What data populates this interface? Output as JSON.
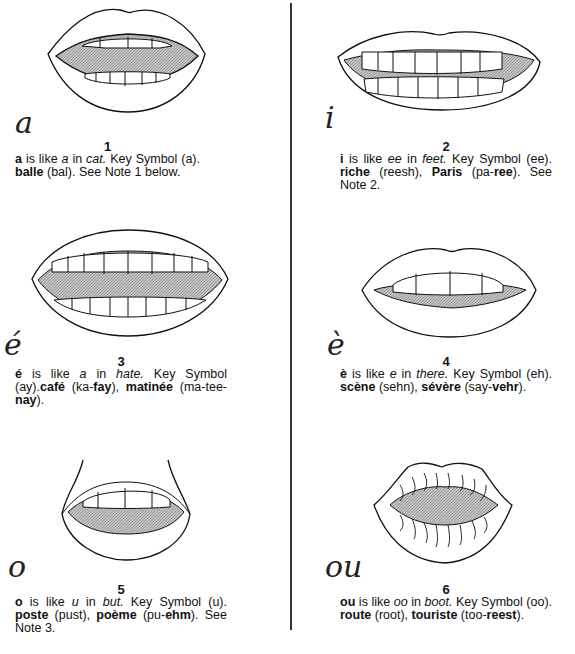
{
  "entries": [
    {
      "number": "1",
      "letter": "a",
      "cursive_glyph": "a",
      "line1": {
        "vowel": "a",
        "t1": " is like ",
        "example": "a",
        "t2": " in ",
        "word": "cat.",
        "t3": " Key Symbol (a)."
      },
      "line2": [
        {
          "text": "balle",
          "bold": true
        },
        {
          "text": " (bal). See Note 1 below.",
          "bold": false
        }
      ]
    },
    {
      "number": "2",
      "letter": "i",
      "cursive_glyph": "i",
      "line1": {
        "vowel": "i",
        "t1": " is like ",
        "example": "ee",
        "t2": " in ",
        "word": "feet.",
        "t3": " Key Symbol (ee)."
      },
      "line2": [
        {
          "text": "riche",
          "bold": true
        },
        {
          "text": " (reesh), ",
          "bold": false
        },
        {
          "text": "Paris",
          "bold": true
        },
        {
          "text": " (pa-",
          "bold": false
        },
        {
          "text": "ree",
          "bold": true
        },
        {
          "text": "). See Note 2.",
          "bold": false
        }
      ]
    },
    {
      "number": "3",
      "letter": "é",
      "cursive_glyph": "é",
      "line1": {
        "vowel": "é",
        "t1": " is like ",
        "example": "a",
        "t2": " in ",
        "word": "hate.",
        "t3": " Key Symbol"
      },
      "line2": [
        {
          "text": "(ay).",
          "bold": false
        },
        {
          "text": "café",
          "bold": true
        },
        {
          "text": " (ka-",
          "bold": false
        },
        {
          "text": "fay",
          "bold": true
        },
        {
          "text": "), ",
          "bold": false
        },
        {
          "text": "matinée",
          "bold": true
        },
        {
          "text": " (ma-tee-",
          "bold": false
        },
        {
          "text": "nay",
          "bold": true
        },
        {
          "text": ").",
          "bold": false
        }
      ]
    },
    {
      "number": "4",
      "letter": "è",
      "cursive_glyph": "è",
      "line1": {
        "vowel": "è",
        "t1": " is like ",
        "example": "e",
        "t2": " in ",
        "word": "there.",
        "t3": " Key Symbol"
      },
      "line2": [
        {
          "text": "(eh). ",
          "bold": false
        },
        {
          "text": "scène",
          "bold": true
        },
        {
          "text": " (sehn), ",
          "bold": false
        },
        {
          "text": "sévère",
          "bold": true
        },
        {
          "text": " (say-",
          "bold": false
        },
        {
          "text": "vehr",
          "bold": true
        },
        {
          "text": ").",
          "bold": false
        }
      ]
    },
    {
      "number": "5",
      "letter": "o",
      "cursive_glyph": "o",
      "line1": {
        "vowel": "o",
        "t1": " is like ",
        "example": "u",
        "t2": " in ",
        "word": "but.",
        "t3": " Key Symbol (u)."
      },
      "line2": [
        {
          "text": "poste",
          "bold": true
        },
        {
          "text": " (pust), ",
          "bold": false
        },
        {
          "text": "poème",
          "bold": true
        },
        {
          "text": " (pu-",
          "bold": false
        },
        {
          "text": "ehm",
          "bold": true
        },
        {
          "text": "). See Note 3.",
          "bold": false
        }
      ]
    },
    {
      "number": "6",
      "letter": "ou",
      "cursive_glyph": "ou",
      "line1": {
        "vowel": "ou",
        "t1": " is like ",
        "example": "oo",
        "t2": " in ",
        "word": "boot.",
        "t3": " Key Symbol"
      },
      "line2": [
        {
          "text": "(oo). ",
          "bold": false
        },
        {
          "text": "route",
          "bold": true
        },
        {
          "text": " (root), ",
          "bold": false
        },
        {
          "text": "touriste",
          "bold": true
        },
        {
          "text": " (too-",
          "bold": false
        },
        {
          "text": "reest",
          "bold": true
        },
        {
          "text": ").",
          "bold": false
        }
      ]
    }
  ],
  "colors": {
    "ink": "#111111",
    "mouth_fill": "#b8b8b8",
    "background": "#ffffff"
  }
}
